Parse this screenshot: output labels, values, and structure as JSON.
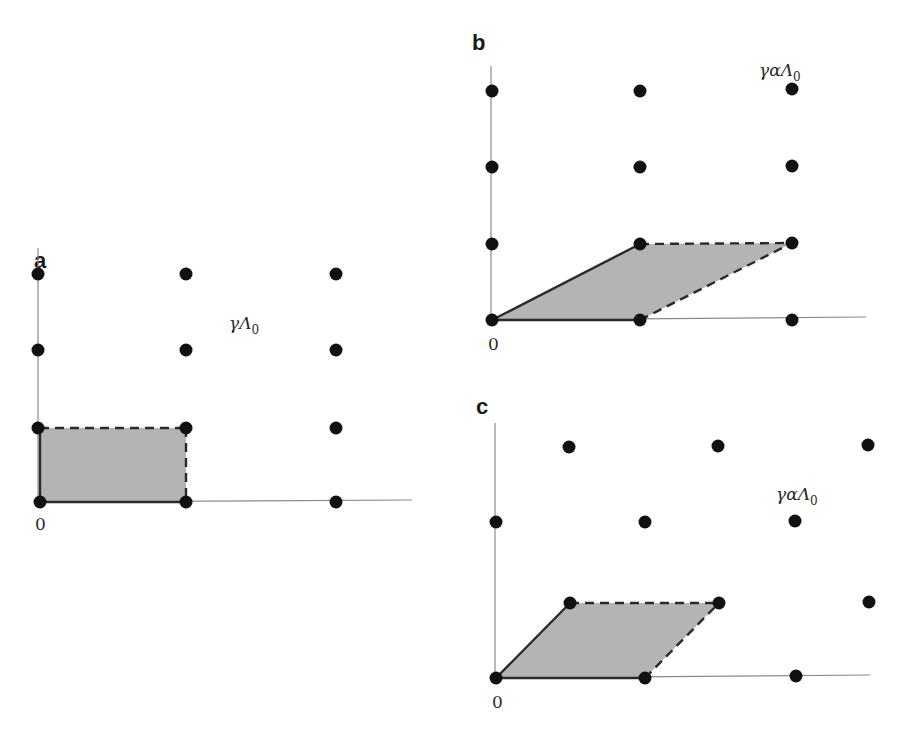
{
  "figure": {
    "panels": [
      {
        "id": "a",
        "label": "a",
        "origin_label": "0",
        "lattice_label": "γΛ₀",
        "lattice_label_parts": {
          "base": "γΛ",
          "sub": "0"
        },
        "description": "Rectangular lattice with shaded rectangular fundamental cell",
        "origin_px": [
          40,
          502
        ],
        "basis_px": {
          "v1": [
            148,
            0
          ],
          "v2": [
            0,
            -76
          ]
        },
        "cell": {
          "shape": "rectangle",
          "solid_edges": [
            "0->v1",
            "0->v2"
          ],
          "dashed_edges": [
            "v2->v1+v2",
            "v1->v1+v2"
          ]
        },
        "dots_px": [
          [
            38,
            274
          ],
          [
            186,
            274
          ],
          [
            336,
            274
          ],
          [
            38,
            350
          ],
          [
            186,
            350
          ],
          [
            336,
            350
          ],
          [
            38,
            428
          ],
          [
            186,
            428
          ],
          [
            336,
            428
          ],
          [
            40,
            502
          ],
          [
            186,
            502
          ],
          [
            336,
            502
          ]
        ],
        "label_px": [
          44,
          196
        ],
        "lattice_label_px": [
          229,
          329
        ]
      },
      {
        "id": "b",
        "label": "b",
        "origin_label": "0",
        "lattice_label": "γαΛ₀",
        "lattice_label_parts": {
          "base": "γαΛ",
          "sub": "0"
        },
        "description": "Same lattice points with sheared parallelogram fundamental cell",
        "origin_px": [
          492,
          320
        ],
        "basis_px": {
          "v1": [
            148,
            0
          ],
          "v2": [
            148,
            -76
          ]
        },
        "cell": {
          "shape": "parallelogram",
          "solid_edges": [
            "0->v1",
            "0->v2"
          ],
          "dashed_edges": [
            "v2->v1+v2",
            "v1->v1+v2"
          ]
        },
        "dots_px": [
          [
            492,
            91
          ],
          [
            640,
            91
          ],
          [
            792,
            89
          ],
          [
            492,
            167
          ],
          [
            640,
            167
          ],
          [
            792,
            166
          ],
          [
            492,
            244
          ],
          [
            640,
            244
          ],
          [
            792,
            243
          ],
          [
            492,
            320
          ],
          [
            640,
            320
          ],
          [
            792,
            320
          ]
        ],
        "label_px": [
          474,
          52
        ],
        "lattice_label_px": [
          759,
          75
        ]
      },
      {
        "id": "c",
        "label": "c",
        "origin_label": "0",
        "lattice_label": "γαΛ₀",
        "lattice_label_parts": {
          "base": "γαΛ",
          "sub": "0"
        },
        "description": "Sheared lattice with parallelogram fundamental cell",
        "origin_px": [
          496,
          678
        ],
        "basis_px": {
          "v1": [
            149,
            0
          ],
          "v2": [
            74,
            -76
          ]
        },
        "cell": {
          "shape": "parallelogram",
          "solid_edges": [
            "0->v1",
            "0->v2"
          ],
          "dashed_edges": [
            "v2->v1+v2",
            "v1->v1+v2"
          ]
        },
        "dots_px": [
          [
            569,
            447
          ],
          [
            718,
            446
          ],
          [
            868,
            445
          ],
          [
            496,
            522
          ],
          [
            645,
            522
          ],
          [
            795,
            521
          ],
          [
            570,
            603
          ],
          [
            719,
            603
          ],
          [
            869,
            602
          ],
          [
            496,
            678
          ],
          [
            645,
            678
          ],
          [
            796,
            676
          ]
        ],
        "label_px": [
          476,
          414
        ],
        "lattice_label_px": [
          776,
          500
        ]
      }
    ]
  }
}
